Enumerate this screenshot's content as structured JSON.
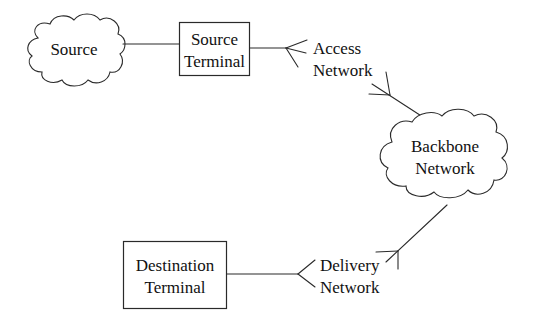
{
  "diagram": {
    "title": "",
    "nodes": {
      "source": {
        "shape": "cloud",
        "lines": [
          "Source"
        ]
      },
      "source_terminal": {
        "shape": "box",
        "lines": [
          "Source",
          "Terminal"
        ]
      },
      "access_network": {
        "shape": "label",
        "lines": [
          "Access",
          "Network"
        ]
      },
      "backbone_network": {
        "shape": "cloud",
        "lines": [
          "Backbone",
          "Network"
        ]
      },
      "delivery_network": {
        "shape": "label",
        "lines": [
          "Delivery",
          "Network"
        ]
      },
      "destination_terminal": {
        "shape": "box",
        "lines": [
          "Destination",
          "Terminal"
        ]
      }
    },
    "edges": [
      {
        "from": "source",
        "to": "source_terminal",
        "style": "plain"
      },
      {
        "from": "source_terminal",
        "to": "access_network",
        "style": "fork-end"
      },
      {
        "from": "access_network",
        "to": "backbone_network",
        "style": "fork-mid"
      },
      {
        "from": "backbone_network",
        "to": "delivery_network",
        "style": "fork-mid"
      },
      {
        "from": "destination_terminal",
        "to": "delivery_network",
        "style": "fork-end"
      }
    ]
  }
}
